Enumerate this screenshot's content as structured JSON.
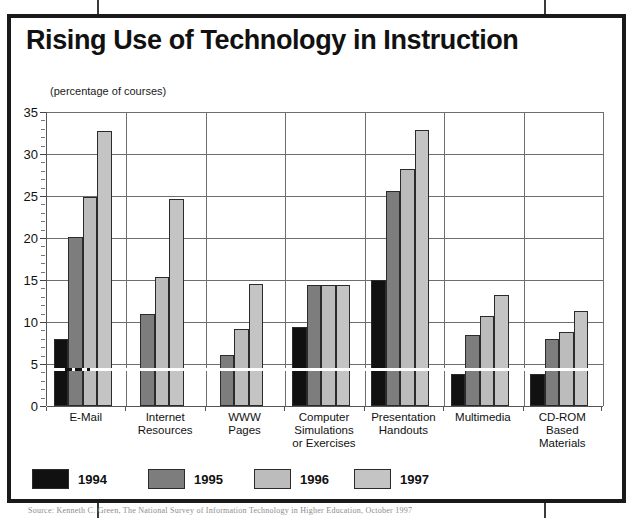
{
  "chart_data": {
    "type": "bar",
    "title": "Rising Use of Technology in Instruction",
    "subtitle": "(percentage of courses)",
    "xlabel": "",
    "ylabel": "(percentage of courses)",
    "ylim": [
      0,
      35
    ],
    "ytick_step": 5,
    "yticks": [
      0,
      5,
      10,
      15,
      20,
      25,
      30,
      35
    ],
    "ytick_labels": [
      "0",
      "5",
      "10",
      "15",
      "20",
      "25",
      "30",
      "35"
    ],
    "minor_tick_step": 1,
    "grid": "horizontal-and-vertical",
    "legend_position": "bottom-left",
    "categories": [
      "E-Mail",
      "Internet Resources",
      "WWW Pages",
      "Computer Simulations or Exercises",
      "Presentation Handouts",
      "Multimedia",
      "CD-ROM Based Materials"
    ],
    "category_lines": [
      [
        "E-Mail"
      ],
      [
        "Internet",
        "Resources"
      ],
      [
        "WWW",
        "Pages"
      ],
      [
        "Computer",
        "Simulations",
        "or Exercises"
      ],
      [
        "Presentation",
        "Handouts"
      ],
      [
        "Multimedia"
      ],
      [
        "CD-ROM",
        "Based",
        "Materials"
      ]
    ],
    "series": [
      {
        "name": "1994",
        "color": "#111111",
        "values": [
          8.0,
          null,
          null,
          9.4,
          15.0,
          3.8,
          3.8
        ]
      },
      {
        "name": "1995",
        "color": "#7d7d7d",
        "values": [
          20.1,
          10.9,
          6.1,
          14.4,
          25.6,
          8.4,
          8.0
        ]
      },
      {
        "name": "1996",
        "color": "#bcbcbc",
        "values": [
          24.9,
          15.4,
          9.2,
          14.4,
          28.2,
          10.7,
          8.8
        ]
      },
      {
        "name": "1997",
        "color": "#c4c4c4",
        "values": [
          32.7,
          24.7,
          14.5,
          14.4,
          32.9,
          13.2,
          11.3
        ]
      }
    ]
  },
  "legend": {
    "items": [
      {
        "label": "1994",
        "color": "#111111"
      },
      {
        "label": "1995",
        "color": "#7d7d7d"
      },
      {
        "label": "1996",
        "color": "#bcbcbc"
      },
      {
        "label": "1997",
        "color": "#c4c4c4"
      }
    ]
  },
  "source": {
    "text": "Source: Kenneth C. Green, The National Survey of Information Technology in Higher Education, October 1997"
  },
  "colors": {
    "frame": "#1a1a1a",
    "grid": "#6e6e6e",
    "axis": "#555555",
    "text": "#111111",
    "background": "#ffffff"
  }
}
